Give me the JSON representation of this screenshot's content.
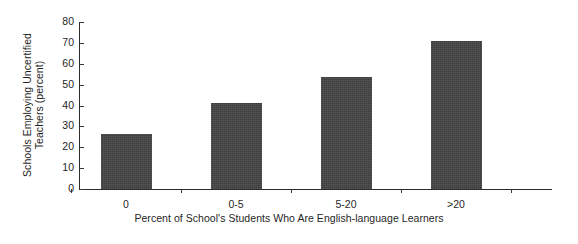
{
  "chart_data": {
    "type": "bar",
    "title": "",
    "subtitle": "",
    "categories": [
      "0",
      "0-5",
      "5-20",
      ">20"
    ],
    "values": [
      26.5,
      41,
      53.5,
      71
    ],
    "xlabel": "Percent of School's Students Who Are English-language Learners",
    "ylabel": "Schools Employing Uncertified Teachers (percent)",
    "ylabel_lines": [
      "Schools Employing Uncertified",
      "Teachers (percent)"
    ],
    "ylim": [
      0,
      80
    ],
    "ytick_labels": [
      "0",
      "10",
      "20",
      "30",
      "40",
      "50",
      "60",
      "70",
      "80"
    ],
    "ytick_values": [
      0,
      10,
      20,
      30,
      40,
      50,
      60,
      70,
      80
    ],
    "ytick_step": 10,
    "grid": false,
    "legend": false,
    "legend_position": "none",
    "bar_color": "#434343",
    "axis_color": "#2b2b2b",
    "background_color": "#ffffff",
    "series": [
      {
        "name": "Schools Employing Uncertified Teachers (percent)",
        "values": [
          26.5,
          41,
          53.5,
          71
        ]
      }
    ]
  }
}
